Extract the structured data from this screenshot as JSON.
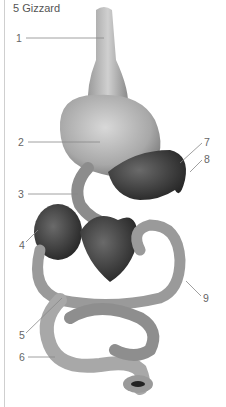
{
  "title": "5 Gizzard",
  "labels": [
    {
      "num": "1",
      "x": 16,
      "y": 33
    },
    {
      "num": "2",
      "x": 18,
      "y": 137
    },
    {
      "num": "3",
      "x": 18,
      "y": 189
    },
    {
      "num": "4",
      "x": 19,
      "y": 240
    },
    {
      "num": "5",
      "x": 19,
      "y": 330
    },
    {
      "num": "6",
      "x": 19,
      "y": 352
    },
    {
      "num": "7",
      "x": 204,
      "y": 137
    },
    {
      "num": "8",
      "x": 204,
      "y": 154
    },
    {
      "num": "9",
      "x": 203,
      "y": 293
    }
  ],
  "colors": {
    "organ_light": "#b5b5b5",
    "organ_mid": "#8e8e8e",
    "organ_dark": "#3a3a3a",
    "leader": "#888888"
  }
}
